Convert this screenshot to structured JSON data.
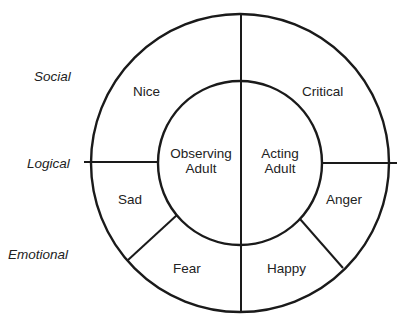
{
  "diagram": {
    "type": "concentric-wheel",
    "side_labels": {
      "social": "Social",
      "logical": "Logical",
      "emotional": "Emotional"
    },
    "inner": {
      "left": {
        "line1": "Observing",
        "line2": "Adult"
      },
      "right": {
        "line1": "Acting",
        "line2": "Adult"
      }
    },
    "outer_segments": {
      "top_left": "Nice",
      "top_right": "Critical",
      "mid_left": "Sad",
      "mid_right": "Anger",
      "bottom_left": "Fear",
      "bottom_right": "Happy"
    },
    "colors": {
      "line": "#1a1a1a",
      "text": "#222222",
      "background": "#ffffff"
    }
  }
}
